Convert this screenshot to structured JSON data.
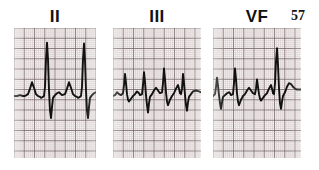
{
  "figure": {
    "kind": "ecg-rhythm-strips",
    "page_number": "57",
    "background_color": "#ffffff",
    "grid_paper_color": "#f7f2f2",
    "grid_fine_color": "#b9a9ab",
    "grid_heavy_color": "#6e5f62",
    "trace_color": "#111111"
  },
  "panels": [
    {
      "label": "II",
      "label_left": 30,
      "label_top": 8,
      "label_width": 50,
      "x": 14,
      "y": 28,
      "width": 82,
      "height": 130,
      "baseline_y": 96,
      "beats": 3,
      "description": "tall narrow R waves with deep S waves and rounded P waves"
    },
    {
      "label": "III",
      "label_left": 128,
      "label_top": 8,
      "label_width": 58,
      "x": 113,
      "y": 28,
      "width": 88,
      "height": 130,
      "baseline_y": 96,
      "beats": 4,
      "description": "moderate R waves with sharp deep S waves"
    },
    {
      "label": "VF",
      "label_left": 228,
      "label_top": 8,
      "label_width": 58,
      "x": 213,
      "y": 28,
      "width": 88,
      "height": 130,
      "baseline_y": 96,
      "beats": 4,
      "description": "mixed amplitude beats, third beat tall spike"
    }
  ],
  "page_number_position": {
    "left": 291,
    "top": 9
  },
  "chart_data": {
    "type": "line",
    "title": "",
    "xlabel": "",
    "ylabel": "",
    "grid": true,
    "legend": "none",
    "axis_note": "ECG graph paper: 1 small square = 0.04 s x 0.1 mV; heavy line every 5 small squares",
    "series": [
      {
        "name": "II",
        "points": [
          [
            0,
            0
          ],
          [
            3,
            0
          ],
          [
            6,
            1
          ],
          [
            9,
            0
          ],
          [
            11,
            0
          ],
          [
            14,
            2
          ],
          [
            16,
            8
          ],
          [
            18,
            15
          ],
          [
            20,
            9
          ],
          [
            22,
            2
          ],
          [
            24,
            0
          ],
          [
            26,
            -1
          ],
          [
            27,
            -2
          ],
          [
            29,
            -1
          ],
          [
            30,
            0
          ],
          [
            31,
            10
          ],
          [
            32,
            40
          ],
          [
            33,
            58
          ],
          [
            34,
            40
          ],
          [
            35,
            6
          ],
          [
            36,
            -16
          ],
          [
            37,
            -24
          ],
          [
            38,
            -12
          ],
          [
            39,
            -2
          ],
          [
            41,
            1
          ],
          [
            43,
            3
          ],
          [
            45,
            4
          ],
          [
            46,
            3
          ],
          [
            48,
            1
          ],
          [
            51,
            2
          ],
          [
            53,
            8
          ],
          [
            55,
            15
          ],
          [
            57,
            9
          ],
          [
            59,
            2
          ],
          [
            61,
            0
          ],
          [
            63,
            -1
          ],
          [
            64,
            -2
          ],
          [
            66,
            -1
          ],
          [
            67,
            0
          ],
          [
            68,
            10
          ],
          [
            69,
            40
          ],
          [
            70,
            57
          ],
          [
            71,
            39
          ],
          [
            72,
            6
          ],
          [
            73,
            -16
          ],
          [
            74,
            -24
          ],
          [
            75,
            -12
          ],
          [
            76,
            -2
          ],
          [
            78,
            1
          ],
          [
            80,
            3
          ],
          [
            82,
            4
          ]
        ]
      },
      {
        "name": "III",
        "points": [
          [
            0,
            0
          ],
          [
            2,
            1
          ],
          [
            4,
            4
          ],
          [
            6,
            2
          ],
          [
            8,
            1
          ],
          [
            10,
            3
          ],
          [
            11,
            12
          ],
          [
            12,
            24
          ],
          [
            13,
            14
          ],
          [
            14,
            2
          ],
          [
            15,
            -4
          ],
          [
            16,
            -6
          ],
          [
            18,
            -3
          ],
          [
            20,
            0
          ],
          [
            22,
            2
          ],
          [
            24,
            5
          ],
          [
            26,
            3
          ],
          [
            27,
            1
          ],
          [
            29,
            2
          ],
          [
            30,
            12
          ],
          [
            31,
            26
          ],
          [
            32,
            15
          ],
          [
            33,
            1
          ],
          [
            34,
            -10
          ],
          [
            35,
            -18
          ],
          [
            36,
            -8
          ],
          [
            37,
            -1
          ],
          [
            39,
            2
          ],
          [
            41,
            6
          ],
          [
            43,
            9
          ],
          [
            45,
            6
          ],
          [
            47,
            3
          ],
          [
            49,
            4
          ],
          [
            50,
            14
          ],
          [
            51,
            30
          ],
          [
            52,
            18
          ],
          [
            53,
            4
          ],
          [
            54,
            -6
          ],
          [
            55,
            -10
          ],
          [
            57,
            -4
          ],
          [
            59,
            0
          ],
          [
            61,
            3
          ],
          [
            63,
            8
          ],
          [
            65,
            12
          ],
          [
            66,
            8
          ],
          [
            67,
            3
          ],
          [
            68,
            2
          ],
          [
            69,
            8
          ],
          [
            70,
            24
          ],
          [
            71,
            14
          ],
          [
            72,
            1
          ],
          [
            73,
            -10
          ],
          [
            74,
            -16
          ],
          [
            75,
            -7
          ],
          [
            76,
            -1
          ],
          [
            78,
            2
          ],
          [
            80,
            5
          ],
          [
            83,
            6
          ],
          [
            86,
            5
          ],
          [
            88,
            4
          ]
        ]
      },
      {
        "name": "VF",
        "points": [
          [
            0,
            0
          ],
          [
            2,
            2
          ],
          [
            3,
            10
          ],
          [
            4,
            20
          ],
          [
            5,
            11
          ],
          [
            6,
            1
          ],
          [
            7,
            -8
          ],
          [
            8,
            -14
          ],
          [
            9,
            -7
          ],
          [
            10,
            -1
          ],
          [
            12,
            1
          ],
          [
            14,
            3
          ],
          [
            16,
            4
          ],
          [
            17,
            3
          ],
          [
            18,
            1
          ],
          [
            20,
            2
          ],
          [
            21,
            14
          ],
          [
            22,
            30
          ],
          [
            23,
            18
          ],
          [
            24,
            3
          ],
          [
            25,
            -6
          ],
          [
            26,
            -10
          ],
          [
            28,
            -4
          ],
          [
            30,
            0
          ],
          [
            32,
            2
          ],
          [
            34,
            6
          ],
          [
            36,
            9
          ],
          [
            38,
            6
          ],
          [
            40,
            3
          ],
          [
            42,
            2
          ],
          [
            43,
            8
          ],
          [
            44,
            18
          ],
          [
            45,
            10
          ],
          [
            46,
            2
          ],
          [
            47,
            -3
          ],
          [
            48,
            -5
          ],
          [
            50,
            -2
          ],
          [
            52,
            1
          ],
          [
            54,
            3
          ],
          [
            56,
            8
          ],
          [
            58,
            12
          ],
          [
            59,
            8
          ],
          [
            60,
            3
          ],
          [
            61,
            2
          ],
          [
            62,
            14
          ],
          [
            63,
            38
          ],
          [
            64,
            52
          ],
          [
            65,
            34
          ],
          [
            66,
            8
          ],
          [
            67,
            -8
          ],
          [
            68,
            -14
          ],
          [
            69,
            -6
          ],
          [
            70,
            0
          ],
          [
            72,
            4
          ],
          [
            74,
            10
          ],
          [
            76,
            14
          ],
          [
            78,
            13
          ],
          [
            80,
            10
          ],
          [
            82,
            8
          ],
          [
            84,
            7
          ],
          [
            86,
            7
          ],
          [
            88,
            7
          ]
        ]
      }
    ]
  }
}
